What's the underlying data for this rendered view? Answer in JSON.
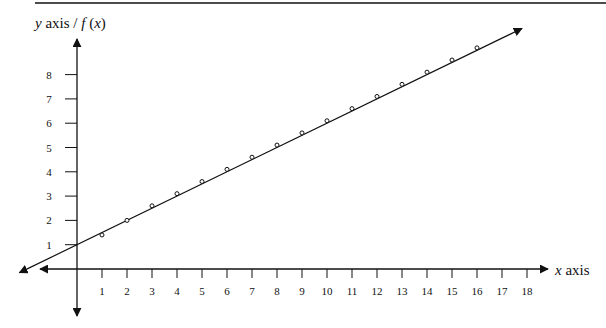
{
  "header_fragment": "",
  "chart_data": {
    "type": "scatter",
    "title": "",
    "xlabel": "x axis",
    "ylabel_prefix": "y axis / ",
    "ylabel_func": "f",
    "ylabel_arg": "(x)",
    "xlim": [
      -3,
      19
    ],
    "ylim": [
      -2,
      10
    ],
    "x_ticks": [
      1,
      2,
      3,
      4,
      5,
      6,
      7,
      8,
      9,
      10,
      11,
      12,
      13,
      14,
      15,
      16,
      17,
      18
    ],
    "y_ticks": [
      1,
      2,
      3,
      4,
      5,
      6,
      7,
      8
    ],
    "grid": false,
    "legend": "none",
    "points": {
      "x": [
        1,
        2,
        3,
        4,
        5,
        6,
        7,
        8,
        9,
        10,
        11,
        12,
        13,
        14,
        15,
        16
      ],
      "y": [
        1.4,
        2.0,
        2.6,
        3.1,
        3.6,
        4.1,
        4.6,
        5.1,
        5.6,
        6.1,
        6.6,
        7.1,
        7.6,
        8.1,
        8.6,
        9.1
      ]
    },
    "fit_line": {
      "slope": 0.5,
      "intercept": 1.0,
      "x_range": [
        -2.3,
        17.8
      ],
      "arrows": "both"
    }
  }
}
